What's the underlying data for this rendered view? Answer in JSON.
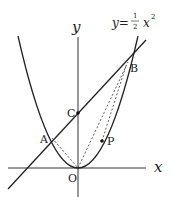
{
  "diagram": {
    "type": "coordinate-geometry",
    "curve_label": {
      "lhs": "y=",
      "frac_num": "1",
      "frac_den": "2",
      "var": "x",
      "exp": "2"
    },
    "axes": {
      "x_label": "x",
      "y_label": "y",
      "origin_label": "O"
    },
    "points": [
      {
        "name": "A",
        "label": "A"
      },
      {
        "name": "B",
        "label": "B"
      },
      {
        "name": "C",
        "label": "C"
      },
      {
        "name": "P",
        "label": "P"
      },
      {
        "name": "O",
        "label": "O"
      }
    ],
    "colors": {
      "stroke": "#222222",
      "background": "#ffffff"
    }
  }
}
